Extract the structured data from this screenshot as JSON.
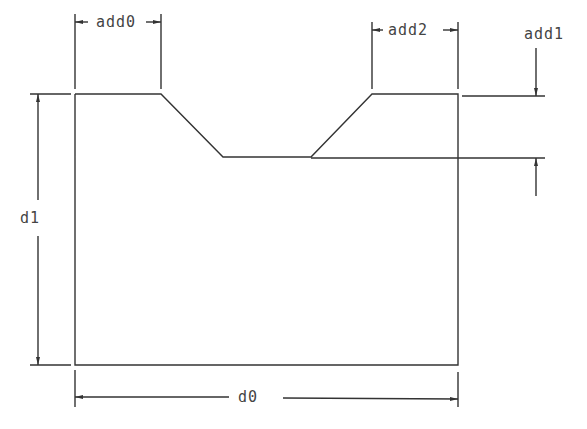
{
  "diagram": {
    "type": "engineering-dimension-drawing",
    "stroke_color": "#333333",
    "labels": {
      "add0": "add0",
      "add2": "add2",
      "add1": "add1",
      "d1": "d1",
      "d0": "d0"
    },
    "geometry": {
      "profile": [
        [
          75,
          94
        ],
        [
          161,
          94
        ],
        [
          223,
          157
        ],
        [
          311,
          157
        ],
        [
          372,
          94
        ],
        [
          458,
          94
        ],
        [
          458,
          365
        ],
        [
          75,
          365
        ]
      ],
      "dimensions": [
        {
          "name": "add0",
          "orientation": "horizontal",
          "from_x": 75,
          "to_x": 161,
          "y": 22
        },
        {
          "name": "add2",
          "orientation": "horizontal",
          "from_x": 372,
          "to_x": 458,
          "y": 30
        },
        {
          "name": "add1",
          "orientation": "vertical",
          "from_y": 94,
          "to_y": 157,
          "x": 537
        },
        {
          "name": "d1",
          "orientation": "vertical",
          "from_y": 94,
          "to_y": 365,
          "x": 38
        },
        {
          "name": "d0",
          "orientation": "horizontal",
          "from_x": 75,
          "to_x": 458,
          "y": 399
        }
      ]
    }
  }
}
